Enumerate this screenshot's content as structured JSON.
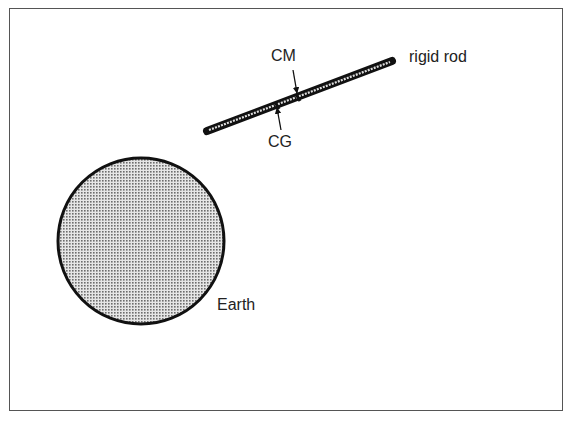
{
  "diagram": {
    "labels": {
      "cm": "CM",
      "cg": "CG",
      "rod": "rigid rod",
      "earth": "Earth"
    },
    "earth": {
      "cx": 141,
      "cy": 241,
      "r": 83,
      "fill": "#c9c9c9",
      "stroke": "#111111"
    },
    "rod": {
      "x1": 207,
      "y1": 131,
      "x2": 392,
      "y2": 61,
      "color": "#111111"
    },
    "markers": {
      "cm_point": {
        "x": 298,
        "y": 96
      },
      "cg_point": {
        "x": 277,
        "y": 104
      }
    }
  }
}
